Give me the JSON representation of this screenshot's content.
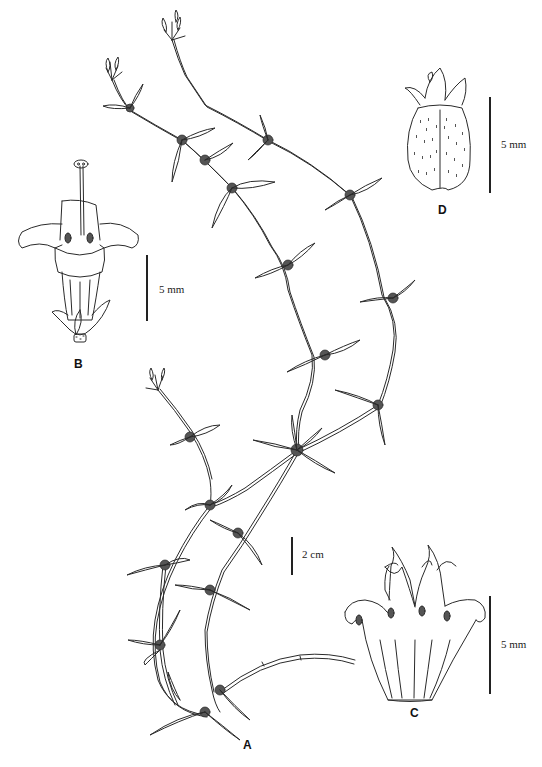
{
  "figure": {
    "type": "botanical illustration plate",
    "ink_color": "#2a2a2a",
    "background": "#ffffff",
    "panels": [
      {
        "id": "A",
        "label": "A",
        "subject": "habit (creeping stems with whorled leaves)",
        "scale": "2 cm"
      },
      {
        "id": "B",
        "label": "B",
        "subject": "flower with exserted style",
        "scale": "5 mm"
      },
      {
        "id": "C",
        "label": "C",
        "subject": "opened corolla with stamens",
        "scale": "5 mm"
      },
      {
        "id": "D",
        "label": "D",
        "subject": "fruit with persistent calyx",
        "scale": "5 mm"
      }
    ]
  }
}
